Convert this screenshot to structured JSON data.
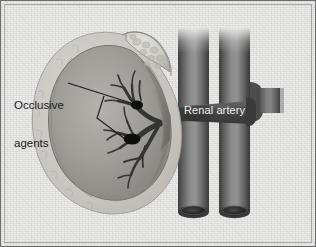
{
  "figure": {
    "kind": "medical-illustration",
    "background_color": "#eeeeec",
    "frame_color": "#6e6e6e"
  },
  "labels": {
    "occlusive_agents": {
      "line1": "Occlusive",
      "line2": "agents",
      "color": "#1b1b1b"
    },
    "renal_artery": {
      "text": "Renal artery",
      "color": "#f2f2f2"
    }
  },
  "anatomy": {
    "kidney": {
      "name": "kidney",
      "capsule_color": "#c9c6c2",
      "cortex_color": "#9a9894",
      "medulla_color": "#807e7a"
    },
    "adrenal_gland": {
      "name": "adrenal-gland",
      "color": "#d2d0cb"
    },
    "renal_artery": {
      "name": "renal-artery",
      "color": "#4a4a4a"
    },
    "aorta": {
      "name": "aorta",
      "color": "#6d6d6d"
    },
    "inferior_vena_cava": {
      "name": "inferior-vena-cava",
      "color": "#6d6d6d"
    },
    "occlusive_agents": {
      "name": "occlusive-agent-particles",
      "color": "#0d0d0d",
      "count": 2
    }
  }
}
